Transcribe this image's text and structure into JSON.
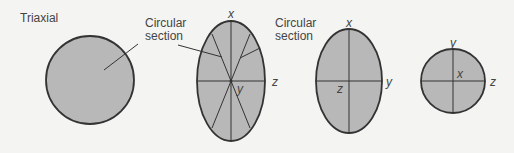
{
  "diagram": {
    "title": "Triaxial",
    "callouts": [
      {
        "line1": "Circular",
        "line2": "section"
      },
      {
        "line1": "Circular",
        "line2": "section"
      }
    ],
    "shapes": [
      {
        "name": "triaxial-sphere",
        "labels": []
      },
      {
        "name": "ellipse-xz",
        "labels": {
          "top": "x",
          "right": "z",
          "center": "y"
        }
      },
      {
        "name": "ellipse-xy",
        "labels": {
          "top": "x",
          "right": "y",
          "center": "z"
        }
      },
      {
        "name": "circle-yz",
        "labels": {
          "top": "y",
          "right": "z",
          "center": "x"
        }
      }
    ],
    "colors": {
      "fill": "#b8b8b8",
      "stroke": "#333333",
      "background": "#f4f4f2"
    }
  }
}
